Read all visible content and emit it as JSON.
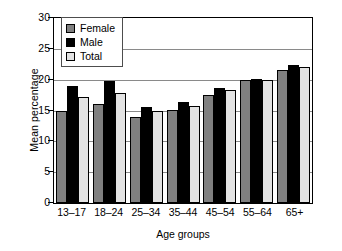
{
  "chart_data": {
    "type": "bar",
    "title": "",
    "xlabel": "Age groups",
    "ylabel": "Mean percentage",
    "categories": [
      "13–17",
      "18–24",
      "25–34",
      "35–44",
      "45–54",
      "55–64",
      "65+"
    ],
    "series": [
      {
        "name": "Female",
        "color": "#808080",
        "values": [
          15.0,
          16.0,
          14.0,
          15.1,
          17.5,
          20.0,
          21.5
        ]
      },
      {
        "name": "Male",
        "color": "#000000",
        "values": [
          19.0,
          19.8,
          15.5,
          16.3,
          18.6,
          20.1,
          22.3
        ]
      },
      {
        "name": "Total",
        "color": "#e3e3e3",
        "values": [
          17.2,
          17.9,
          15.0,
          15.7,
          18.3,
          20.0,
          22.0
        ]
      }
    ],
    "ylim": [
      0,
      30
    ],
    "yticks": [
      0,
      5,
      10,
      15,
      20,
      25,
      30
    ],
    "ytick_labels": [
      "0",
      "5",
      "10",
      "15",
      "20",
      "25",
      "30"
    ],
    "grid": true,
    "grid_axis": "y",
    "legend_position": "top-left-inside",
    "legend_entries": [
      "Female",
      "Male",
      "Total"
    ]
  },
  "axes": {
    "y_title": "Mean percentage",
    "x_title": "Age groups"
  }
}
